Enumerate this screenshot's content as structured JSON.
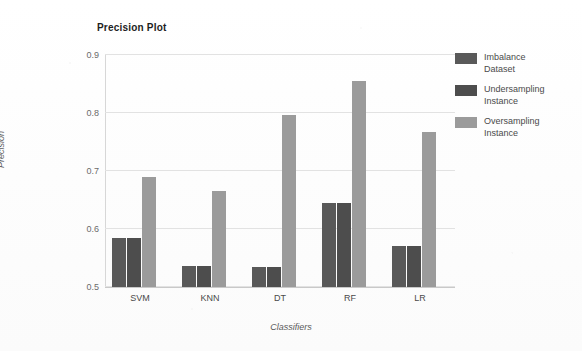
{
  "chart_data": {
    "type": "bar",
    "title": "Precision Plot",
    "xlabel": "Classifiers",
    "ylabel": "Precision",
    "categories": [
      "SVM",
      "KNN",
      "DT",
      "RF",
      "LR"
    ],
    "ylim": [
      0.5,
      0.9
    ],
    "yticks": [
      "0.5",
      "0.6",
      "0.7",
      "0.8",
      "0.9"
    ],
    "ytick_values": [
      0.5,
      0.6,
      0.7,
      0.8,
      0.9
    ],
    "grid": true,
    "legend_position": "right",
    "series": [
      {
        "name": "Imbalance Dataset",
        "color": "#595959",
        "values": [
          0.585,
          0.537,
          0.535,
          0.645,
          0.571
        ]
      },
      {
        "name": "Undersampling Instance",
        "color": "#4d4d4d",
        "values": [
          0.585,
          0.537,
          0.535,
          0.645,
          0.571
        ]
      },
      {
        "name": "Oversampling Instance",
        "color": "#9b9b9b",
        "values": [
          0.69,
          0.665,
          0.797,
          0.855,
          0.767
        ]
      }
    ]
  },
  "legend": {
    "items": [
      {
        "line1": "Imbalance",
        "line2": "Dataset"
      },
      {
        "line1": "Undersampling",
        "line2": "Instance"
      },
      {
        "line1": "Oversampling",
        "line2": "Instance"
      }
    ]
  }
}
